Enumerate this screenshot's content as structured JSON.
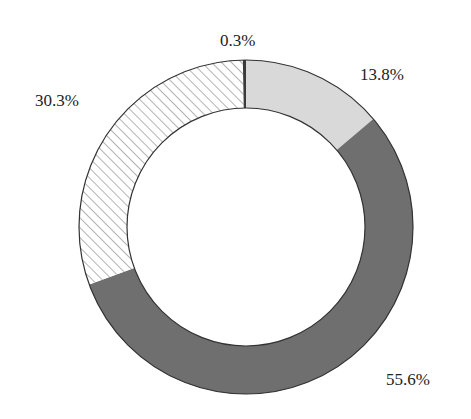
{
  "chart_data": {
    "type": "pie",
    "variant": "donut",
    "title": "",
    "start_angle_deg": 0,
    "direction": "clockwise",
    "center": [
      246,
      227
    ],
    "outer_radius": 167,
    "inner_radius": 119,
    "slices": [
      {
        "label": "13.8%",
        "value": 13.8,
        "fill": "#d9d9d9",
        "pattern": "solid",
        "label_pos": [
          360,
          66
        ]
      },
      {
        "label": "55.6%",
        "value": 55.6,
        "fill": "#6f6f6f",
        "pattern": "solid",
        "label_pos": [
          386,
          371
        ]
      },
      {
        "label": "30.3%",
        "value": 30.3,
        "fill": "#ffffff",
        "pattern": "hatch",
        "hatch_color": "#8a8a8a",
        "label_pos": [
          35,
          92
        ]
      },
      {
        "label": "0.3%",
        "value": 0.3,
        "fill": "#3a3a3a",
        "pattern": "solid",
        "label_pos": [
          220,
          32
        ]
      }
    ],
    "legend": null,
    "xlabel": "",
    "ylabel": ""
  }
}
